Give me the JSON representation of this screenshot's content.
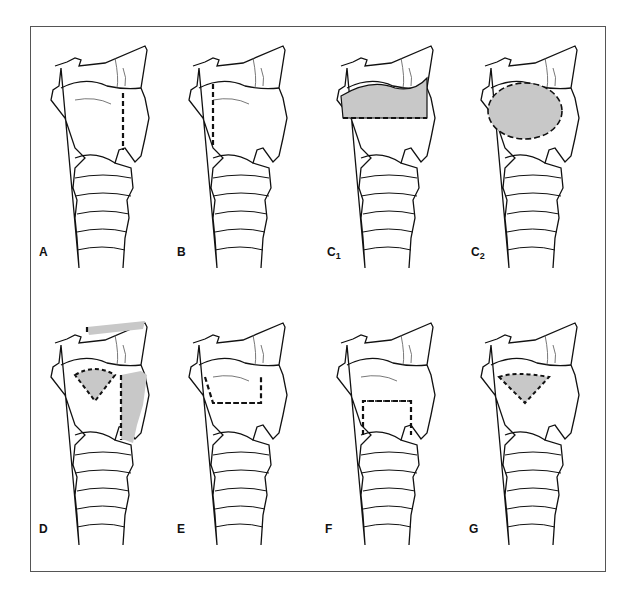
{
  "figure": {
    "panels": [
      {
        "id": "A",
        "label": "A",
        "sub": "",
        "cut": "vertical-right"
      },
      {
        "id": "B",
        "label": "B",
        "sub": "",
        "cut": "vertical-left"
      },
      {
        "id": "C1",
        "label": "C",
        "sub": "1",
        "cut": "horizontal-upper-shaded"
      },
      {
        "id": "C2",
        "label": "C",
        "sub": "2",
        "cut": "ellipse-shaded"
      },
      {
        "id": "D",
        "label": "D",
        "sub": "",
        "cut": "triangle-and-lateral-shaded"
      },
      {
        "id": "E",
        "label": "E",
        "sub": "",
        "cut": "upper-rectangle-dotted"
      },
      {
        "id": "F",
        "label": "F",
        "sub": "",
        "cut": "lower-rectangle-dotted"
      },
      {
        "id": "G",
        "label": "G",
        "sub": "",
        "cut": "triangle-shaded"
      }
    ],
    "colors": {
      "shade": "#c8c8c8",
      "line": "#111111",
      "frame": "#555555"
    }
  }
}
